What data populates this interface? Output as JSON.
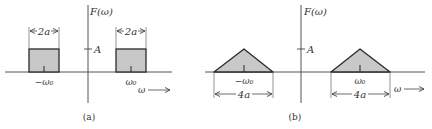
{
  "colors": {
    "background": "#ffffff",
    "axis": "#555555",
    "outline": "#2a2a2a",
    "fill": "#c8c8c8",
    "text": "#333333"
  },
  "panels": [
    {
      "id": "a",
      "caption": "(a)",
      "y_axis_label": "F(ω)",
      "amplitude_label": "A",
      "x_axis_label": "ω",
      "arrow": "→",
      "shape": "rectangle",
      "width_label": "2a",
      "center_labels": [
        "−ω₀",
        "ω₀"
      ]
    },
    {
      "id": "b",
      "caption": "(b)",
      "y_axis_label": "F(ω)",
      "amplitude_label": "A",
      "x_axis_label": "ω",
      "arrow": "→",
      "shape": "triangle",
      "width_label": "4a",
      "center_labels": [
        "−ω₀",
        "ω₀"
      ]
    }
  ]
}
